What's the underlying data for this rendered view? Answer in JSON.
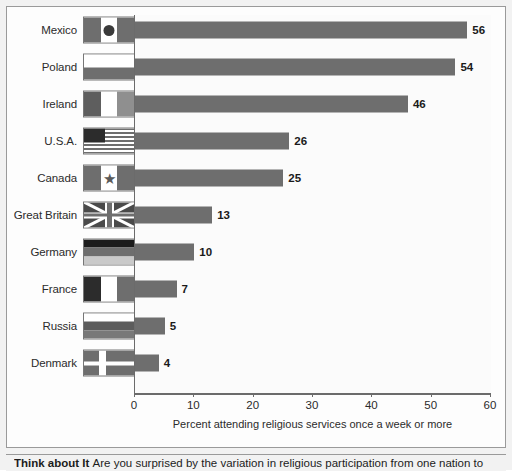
{
  "chart_data": {
    "type": "bar",
    "orientation": "horizontal",
    "title": "",
    "xlabel": "Percent attending religious services once a week or more",
    "ylabel": "",
    "xlim": [
      0,
      60
    ],
    "xticks": [
      0,
      10,
      20,
      30,
      40,
      50,
      60
    ],
    "xtick_labels": [
      "0",
      "10",
      "20",
      "30",
      "40",
      "50",
      "60"
    ],
    "grid": false,
    "legend": "none",
    "bar_color": "#6e6e6e",
    "categories": [
      "Mexico",
      "Poland",
      "Ireland",
      "U.S.A.",
      "Canada",
      "Great Britain",
      "Germany",
      "France",
      "Russia",
      "Denmark"
    ],
    "values": [
      56,
      54,
      46,
      26,
      25,
      13,
      10,
      7,
      5,
      4
    ],
    "value_labels": [
      "56",
      "54",
      "46",
      "26",
      "25",
      "13",
      "10",
      "7",
      "5",
      "4"
    ]
  },
  "rows": [
    {
      "country": "Mexico",
      "value": 56,
      "label": "56",
      "flag": "flag-mexico"
    },
    {
      "country": "Poland",
      "value": 54,
      "label": "54",
      "flag": "flag-poland"
    },
    {
      "country": "Ireland",
      "value": 46,
      "label": "46",
      "flag": "flag-ireland"
    },
    {
      "country": "U.S.A.",
      "value": 26,
      "label": "26",
      "flag": "flag-usa"
    },
    {
      "country": "Canada",
      "value": 25,
      "label": "25",
      "flag": "flag-canada"
    },
    {
      "country": "Great Britain",
      "value": 13,
      "label": "13",
      "flag": "flag-great-britain"
    },
    {
      "country": "Germany",
      "value": 10,
      "label": "10",
      "flag": "flag-germany"
    },
    {
      "country": "France",
      "value": 7,
      "label": "7",
      "flag": "flag-france"
    },
    {
      "country": "Russia",
      "value": 5,
      "label": "5",
      "flag": "flag-russia"
    },
    {
      "country": "Denmark",
      "value": 4,
      "label": "4",
      "flag": "flag-denmark"
    }
  ],
  "axis": {
    "title": "Percent attending religious services once a week or more",
    "ticks": [
      "0",
      "10",
      "20",
      "30",
      "40",
      "50",
      "60"
    ]
  },
  "caption": {
    "lead": "Think about It",
    "body": "Are you surprised by the variation in religious participation from one nation to"
  }
}
